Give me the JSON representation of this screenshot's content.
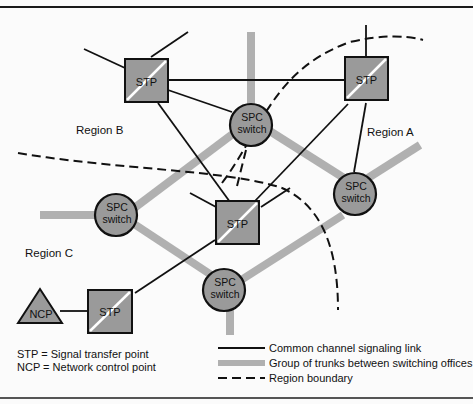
{
  "diagram": {
    "regions": [
      {
        "id": "A",
        "label": "Region A"
      },
      {
        "id": "B",
        "label": "Region B"
      },
      {
        "id": "C",
        "label": "Region C"
      }
    ],
    "nodes": {
      "stp_b": {
        "type": "STP",
        "label": "STP"
      },
      "stp_a": {
        "type": "STP",
        "label": "STP"
      },
      "stp_center": {
        "type": "STP",
        "label": "STP"
      },
      "stp_c": {
        "type": "STP",
        "label": "STP"
      },
      "ncp": {
        "type": "NCP",
        "label": "NCP"
      },
      "spc_top": {
        "type": "SPC",
        "line1": "SPC",
        "line2": "switch"
      },
      "spc_right": {
        "type": "SPC",
        "line1": "SPC",
        "line2": "switch"
      },
      "spc_left": {
        "type": "SPC",
        "line1": "SPC",
        "line2": "switch"
      },
      "spc_bottom": {
        "type": "SPC",
        "line1": "SPC",
        "line2": "switch"
      }
    },
    "abbreviations": [
      {
        "abbr": "STP",
        "eq": "=",
        "meaning": "Signal transfer point"
      },
      {
        "abbr": "NCP",
        "eq": "=",
        "meaning": "Network control point"
      }
    ],
    "legend": [
      {
        "style": "solid-line",
        "label": "Common channel signaling link"
      },
      {
        "style": "thick-gray",
        "label": "Group of trunks between switching offices"
      },
      {
        "style": "dashed-line",
        "label": "Region boundary"
      }
    ],
    "colors": {
      "node_fill": "#9a9a9a",
      "trunk": "#b0b0b0",
      "line": "#111111",
      "background": "#fbfbfb"
    }
  }
}
